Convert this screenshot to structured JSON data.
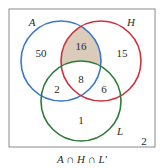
{
  "diagram": {
    "type": "venn",
    "caption": "A ∩ H ∩ L′",
    "universe_count": "2",
    "sets": [
      {
        "name": "A",
        "color": "#3a78c8"
      },
      {
        "name": "H",
        "color": "#d0303c"
      },
      {
        "name": "L",
        "color": "#2e7a3a"
      }
    ],
    "regions": {
      "A_only": "50",
      "A_and_H_only": "16",
      "H_only": "15",
      "A_and_L_only": "2",
      "A_H_L": "8",
      "H_and_L_only": "6",
      "L_only": "1"
    },
    "shaded_region": "A_and_H_only",
    "shade_color": "#dacbbb",
    "border_color": "#8a8a8a"
  }
}
